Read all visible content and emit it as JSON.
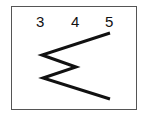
{
  "labels": [
    "3",
    "4",
    "5"
  ],
  "figure": {
    "shape": "zigzag-polyline",
    "points": [
      [
        110,
        33
      ],
      [
        42,
        55
      ],
      [
        76,
        67
      ],
      [
        43,
        78
      ],
      [
        110,
        99
      ]
    ],
    "stroke": "#111111"
  }
}
